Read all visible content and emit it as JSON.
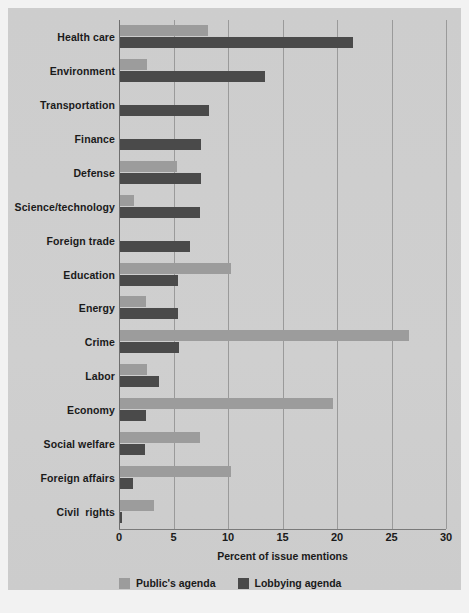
{
  "chart_data": {
    "type": "bar",
    "orientation": "horizontal",
    "title": "",
    "xlabel": "Percent of issue mentions",
    "ylabel": "",
    "xlim": [
      0,
      30
    ],
    "xticks": [
      0,
      5,
      10,
      15,
      20,
      25,
      30
    ],
    "xtick_labels": [
      "0",
      "5",
      "10",
      "15",
      "20",
      "25",
      "30"
    ],
    "grid": true,
    "grid_axis": "x",
    "legend_position": "below-axis-left",
    "categories": [
      "Health care",
      "Environment",
      "Transportation",
      "Finance",
      "Defense",
      "Science/technology",
      "Foreign trade",
      "Education",
      "Energy",
      "Crime",
      "Labor",
      "Economy",
      "Social welfare",
      "Foreign affairs",
      "Civil  rights"
    ],
    "series": [
      {
        "name": "Public's agenda",
        "color": "#9c9c9c",
        "values": [
          8.1,
          2.5,
          0.0,
          0.0,
          5.2,
          1.3,
          0.0,
          10.2,
          2.4,
          26.5,
          2.5,
          19.5,
          7.3,
          10.2,
          3.1
        ]
      },
      {
        "name": "Lobbying agenda",
        "color": "#4a4a4a",
        "values": [
          21.4,
          13.3,
          8.2,
          7.4,
          7.4,
          7.3,
          6.4,
          5.3,
          5.3,
          5.4,
          3.6,
          2.4,
          2.3,
          1.2,
          0.2
        ]
      }
    ]
  },
  "legend": {
    "items": [
      {
        "label": "Public's agenda",
        "swatch": "light"
      },
      {
        "label": "Lobbying agenda",
        "swatch": "dark"
      }
    ]
  },
  "colors": {
    "background": "#f2f2f2",
    "panel": "#cfcfcf",
    "public_agenda": "#9c9c9c",
    "lobbying_agenda": "#4a4a4a",
    "gridline": "#9a9a9a",
    "text": "#1a1a1a"
  }
}
